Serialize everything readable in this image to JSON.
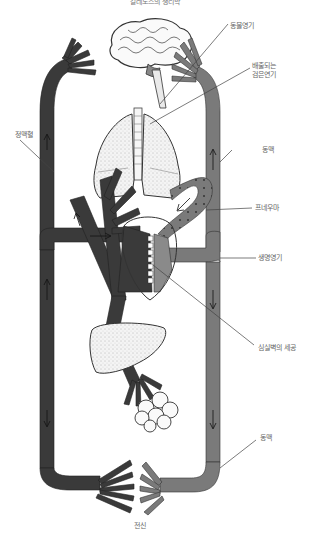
{
  "title": "갈레노스의 생리학",
  "labels": {
    "animal_spirit": "동물영기",
    "exhaled_smoke_line1": "배출되는",
    "exhaled_smoke_line2": "검은연기",
    "venous_blood": "정맥혈",
    "artery_upper": "동맥",
    "pneuma": "프네우마",
    "vital_spirit": "생명영기",
    "septum_pores": "심실벽의 세공",
    "artery_lower": "동맥",
    "whole_body": "전신"
  },
  "colors": {
    "venous": "#3a3a3a",
    "arterial": "#7a7a7a",
    "organ_fill": "#f2f2f2",
    "line": "#444444",
    "label": "#666666"
  }
}
